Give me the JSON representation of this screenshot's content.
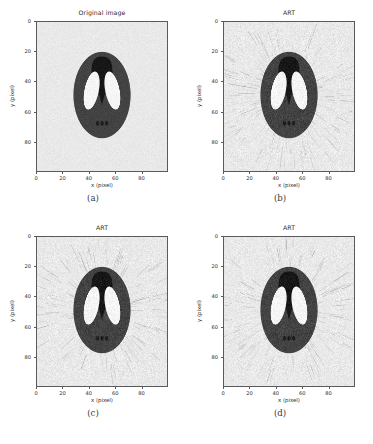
{
  "figure": {
    "background_color": "#ffffff",
    "panel_background_color": "#e9e9e9",
    "frame_color": "#5a5a5a",
    "text_color": "#2b2b2b"
  },
  "axis": {
    "xlabel": "x (pixel)",
    "ylabel": "y (pixel)",
    "xticks": [
      0,
      20,
      40,
      60,
      80
    ],
    "yticks": [
      0,
      20,
      40,
      60,
      80
    ],
    "xlim": [
      0,
      100
    ],
    "ylim": [
      100,
      0
    ],
    "grid": false
  },
  "panels": [
    {
      "id": "a",
      "title": "Original image",
      "caption": "(a)",
      "noise": "none",
      "streaks": 0,
      "streak_opacity": 0.0,
      "grain": 0.03,
      "blur": 0.25
    },
    {
      "id": "b",
      "title": "ART",
      "caption": "(b)",
      "noise": "streak",
      "streaks": 470,
      "streak_opacity": 0.3,
      "grain": 0.06,
      "blur": 0.45
    },
    {
      "id": "c",
      "title": "ART",
      "caption": "(c)",
      "noise": "streak",
      "streaks": 470,
      "streak_opacity": 0.3,
      "grain": 0.06,
      "blur": 0.45
    },
    {
      "id": "d",
      "title": "ART",
      "caption": "(d)",
      "noise": "streak",
      "streaks": 470,
      "streak_opacity": 0.3,
      "grain": 0.06,
      "blur": 0.45
    }
  ],
  "chart_data": {
    "type": "heatmap",
    "xlabel": "x (pixel)",
    "ylabel": "y (pixel)",
    "xlim": [
      0,
      100
    ],
    "ylim": [
      100,
      0
    ],
    "xticks": [
      0,
      20,
      40,
      60,
      80
    ],
    "yticks": [
      0,
      20,
      40,
      60,
      80
    ],
    "grid": false,
    "legend": "none",
    "colormap": "gray",
    "panel_titles": [
      "Original image",
      "ART",
      "ART",
      "ART"
    ],
    "panel_captions": [
      "(a)",
      "(b)",
      "(c)",
      "(d)"
    ],
    "phantom_features": [
      {
        "name": "background",
        "shape": "rect",
        "gray": 0.91,
        "hex": "#e9e9e9"
      },
      {
        "name": "outer-skull-ellipse",
        "shape": "ellipse",
        "cx": 50,
        "cy": 49,
        "rx": 22,
        "ry": 29,
        "gray": 0.26,
        "hex": "#434343"
      },
      {
        "name": "top-dark-blob",
        "shape": "teardrop",
        "cx": 50,
        "cy": 34,
        "rx": 8,
        "ry": 9,
        "gray": 0.08,
        "hex": "#171717"
      },
      {
        "name": "left-white-ellipse",
        "shape": "ellipse",
        "cx": 42,
        "cy": 46,
        "rx": 5.5,
        "ry": 13,
        "gray": 0.97,
        "hex": "#f6f6f6"
      },
      {
        "name": "right-white-ellipse",
        "shape": "ellipse",
        "cx": 58,
        "cy": 46,
        "rx": 5.5,
        "ry": 13,
        "gray": 0.97,
        "hex": "#f6f6f6"
      },
      {
        "name": "bottom-dot-left",
        "shape": "ellipse",
        "cx": 46.5,
        "cy": 68,
        "rx": 1.3,
        "ry": 1.6,
        "gray": 0.12,
        "hex": "#1f1f1f"
      },
      {
        "name": "bottom-dot-center",
        "shape": "ellipse",
        "cx": 50,
        "cy": 68,
        "rx": 1.3,
        "ry": 1.6,
        "gray": 0.12,
        "hex": "#1f1f1f"
      },
      {
        "name": "bottom-dot-right",
        "shape": "ellipse",
        "cx": 53.5,
        "cy": 68,
        "rx": 1.3,
        "ry": 1.6,
        "gray": 0.12,
        "hex": "#1f1f1f"
      }
    ],
    "gray_levels": {
      "background": "#e9e9e9",
      "skull": "#434343",
      "dark_blob": "#171717",
      "white_inclusions": "#f6f6f6",
      "small_dots": "#1f1f1f"
    }
  }
}
